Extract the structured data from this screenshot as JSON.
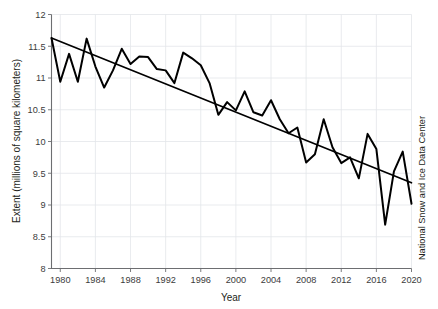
{
  "chart_data": {
    "type": "line",
    "title": "",
    "xlabel": "Year",
    "ylabel": "Extent (millions of square kilometers)",
    "credit": "National Snow and Ice Data Center",
    "xlim": [
      1979,
      2020
    ],
    "ylim": [
      8,
      12
    ],
    "grid": true,
    "legend": "none",
    "xticks": [
      1980,
      1984,
      1988,
      1992,
      1996,
      2000,
      2004,
      2008,
      2012,
      2016,
      2020
    ],
    "yticks": [
      8,
      8.5,
      9,
      9.5,
      10,
      10.5,
      11,
      11.5,
      12
    ],
    "xtick_labels": [
      "1980",
      "1984",
      "1988",
      "1992",
      "1996",
      "2000",
      "2004",
      "2008",
      "2012",
      "2016",
      "2020"
    ],
    "ytick_labels": [
      "8",
      "8.5",
      "9",
      "9.5",
      "10",
      "10.5",
      "11",
      "11.5",
      "12"
    ],
    "series": [
      {
        "name": "Arctic sea ice extent",
        "color": "#000000",
        "x": [
          1979,
          1980,
          1981,
          1982,
          1983,
          1984,
          1985,
          1986,
          1987,
          1988,
          1989,
          1990,
          1991,
          1992,
          1993,
          1994,
          1995,
          1996,
          1997,
          1998,
          1999,
          2000,
          2001,
          2002,
          2003,
          2004,
          2005,
          2006,
          2007,
          2008,
          2009,
          2010,
          2011,
          2012,
          2013,
          2014,
          2015,
          2016,
          2017,
          2018,
          2019,
          2020
        ],
        "values": [
          11.63,
          10.94,
          11.38,
          10.94,
          11.62,
          11.18,
          10.85,
          11.12,
          11.46,
          11.22,
          11.34,
          11.33,
          11.14,
          11.12,
          10.92,
          11.4,
          11.31,
          11.2,
          10.92,
          10.42,
          10.62,
          10.49,
          10.79,
          10.46,
          10.41,
          10.65,
          10.35,
          10.13,
          10.22,
          9.67,
          9.8,
          10.35,
          9.91,
          9.66,
          9.75,
          9.42,
          10.12,
          9.88,
          8.69,
          9.53,
          9.84,
          9.02
        ]
      },
      {
        "name": "Linear trend",
        "color": "#000000",
        "x": [
          1979,
          2020
        ],
        "values": [
          11.63,
          9.35
        ]
      }
    ]
  },
  "axes": {
    "x_title": "Year",
    "y_title": "Extent (millions of square kilometers)",
    "right_credit": "National Snow and Ice Data Center"
  }
}
